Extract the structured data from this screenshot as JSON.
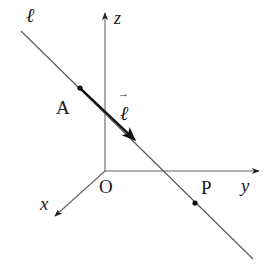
{
  "diagram": {
    "type": "3d-coordinate-line",
    "colors": {
      "background": "#ffffff",
      "axis": "#555555",
      "line": "#555555",
      "vector": "#111111",
      "text": "#1a1a1a"
    },
    "labels": {
      "line": "ℓ",
      "vector": "ℓ",
      "vector_arrow": "→",
      "point_a": "A",
      "point_p": "P",
      "origin": "O",
      "axis_x": "x",
      "axis_y": "y",
      "axis_z": "z"
    },
    "geometry": {
      "origin": [
        105,
        171
      ],
      "z_axis_end": [
        105,
        12
      ],
      "y_axis_end": [
        260,
        171
      ],
      "x_axis_end": [
        54,
        217
      ],
      "line_start": [
        21,
        31
      ],
      "line_end": [
        253,
        259
      ],
      "point_a": [
        80,
        88
      ],
      "vector_end": [
        136,
        141
      ],
      "point_p": [
        195,
        203
      ]
    }
  }
}
